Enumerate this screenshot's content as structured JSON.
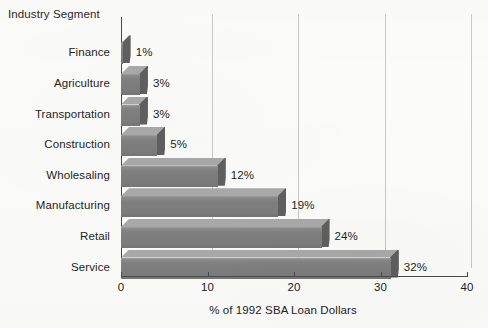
{
  "chart_data": {
    "type": "bar",
    "orientation": "horizontal",
    "title": "",
    "xlabel": "% of 1992 SBA Loan Dollars",
    "ylabel": "Industry Segment",
    "categories": [
      "Finance",
      "Agriculture",
      "Transportation",
      "Construction",
      "Wholesaling",
      "Manufacturing",
      "Retail",
      "Service"
    ],
    "values": [
      1,
      3,
      3,
      5,
      12,
      19,
      24,
      32
    ],
    "value_labels": [
      "1%",
      "3%",
      "3%",
      "5%",
      "12%",
      "19%",
      "24%",
      "32%"
    ],
    "xlim": [
      0,
      40
    ],
    "xticks": [
      0,
      10,
      20,
      30,
      40
    ],
    "xtick_labels": [
      "0",
      "10",
      "20",
      "30",
      "40"
    ],
    "grid": true,
    "grid_axis": "x",
    "legend": false,
    "style": "3d-blocks",
    "bar_color": "#808080",
    "bar_top_color": "#a9a9a9",
    "bar_side_color": "#5f5f5f",
    "background": "#fbfbfa",
    "axis_color": "#4a4a4a",
    "gridline_color": "#c8c8c8"
  }
}
